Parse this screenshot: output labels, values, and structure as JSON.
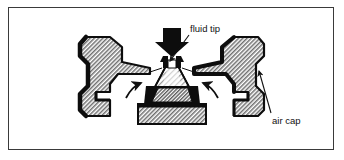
{
  "figure": {
    "kind": "technical-cutaway-diagram",
    "background_color": "#ffffff",
    "frame_color": "#3a3a3a"
  },
  "palette": {
    "ink": "#111111",
    "hatch_gray": "#8a8a8a",
    "hatch_light": "#b8b8b8",
    "solid_black": "#0d0d0d",
    "frame": "#3a3a3a",
    "white": "#ffffff"
  },
  "labels": [
    {
      "id": "fluid-tip",
      "text": "fluid tip",
      "x": 190,
      "y": 32,
      "anchor": "start",
      "leader_from": [
        189,
        35
      ],
      "leader_to": [
        168,
        62
      ],
      "arrowhead": true
    },
    {
      "id": "air-cap",
      "text": "air cap",
      "x": 272,
      "y": 122,
      "anchor": "start",
      "leader_from": [
        271,
        113
      ],
      "leader_to": [
        258,
        70
      ],
      "arrowhead": true
    }
  ],
  "parts": [
    {
      "id": "air-cap-left",
      "name": "air cap left horn",
      "fill": "hatch",
      "outline": "#0d0d0d"
    },
    {
      "id": "air-cap-right",
      "name": "air cap right horn",
      "fill": "hatch",
      "outline": "#0d0d0d"
    },
    {
      "id": "fluid-tip-nozzle",
      "name": "fluid tip nozzle",
      "fill": "solid-black"
    },
    {
      "id": "fluid-cone",
      "name": "fluid tip tapered body",
      "fill": "hatch-light"
    },
    {
      "id": "retaining-base",
      "name": "retaining ring base",
      "fill": "hatch"
    },
    {
      "id": "black-collar",
      "name": "seal collar",
      "fill": "solid-black"
    }
  ],
  "flow_indicators": [
    {
      "id": "fluid-feed-arrow",
      "name": "fluid feed arrow",
      "direction": "down",
      "style": "solid-block",
      "color": "#0d0d0d"
    },
    {
      "id": "air-flow-left",
      "name": "left atomizing air stream",
      "direction": "up-right",
      "style": "curved"
    },
    {
      "id": "air-flow-right",
      "name": "right atomizing air stream",
      "direction": "up-left",
      "style": "curved"
    }
  ]
}
